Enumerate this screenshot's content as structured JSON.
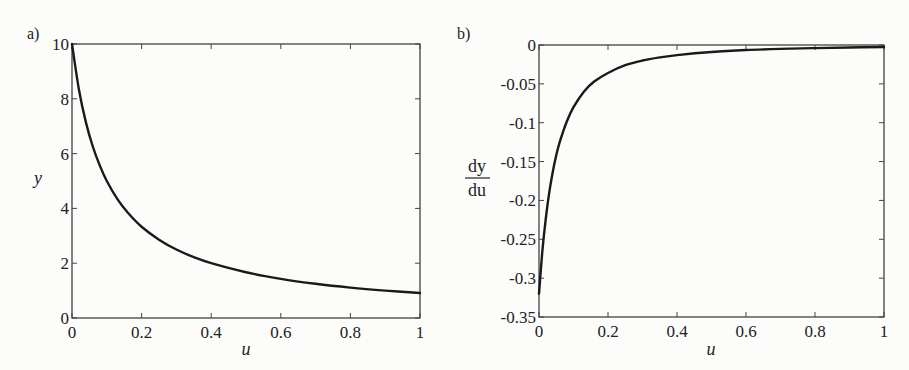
{
  "chart_data": [
    {
      "panel": "a)",
      "type": "line",
      "title": "",
      "xlabel": "u",
      "ylabel": "y",
      "xlim": [
        0,
        1
      ],
      "ylim": [
        0,
        10
      ],
      "xticks": [
        "0",
        "0.2",
        "0.4",
        "0.6",
        "0.8",
        "1"
      ],
      "yticks": [
        "0",
        "2",
        "4",
        "6",
        "8",
        "10"
      ],
      "grid": false,
      "legend": null,
      "series": [
        {
          "name": "y",
          "x": [
            0,
            0.02,
            0.04,
            0.06,
            0.08,
            0.1,
            0.13,
            0.16,
            0.2,
            0.25,
            0.3,
            0.35,
            0.4,
            0.5,
            0.6,
            0.7,
            0.8,
            0.9,
            1.0
          ],
          "values": [
            10.0,
            8.33,
            7.14,
            6.25,
            5.56,
            5.0,
            4.35,
            3.85,
            3.33,
            2.86,
            2.5,
            2.22,
            2.0,
            1.67,
            1.43,
            1.25,
            1.11,
            1.0,
            0.91
          ]
        }
      ]
    },
    {
      "panel": "b)",
      "type": "line",
      "title": "",
      "xlabel": "u",
      "ylabel": "dy/du",
      "ylabel_numerator": "dy",
      "ylabel_denominator": "du",
      "xlim": [
        0,
        1
      ],
      "ylim": [
        -0.35,
        0
      ],
      "xticks": [
        "0",
        "0.2",
        "0.4",
        "0.6",
        "0.8",
        "1"
      ],
      "yticks": [
        "0",
        "-0.05",
        "-0.1",
        "-0.15",
        "-0.2",
        "-0.25",
        "-0.3",
        "-0.35"
      ],
      "grid": false,
      "legend": null,
      "series": [
        {
          "name": "dy/du",
          "x": [
            0,
            0.01,
            0.02,
            0.03,
            0.04,
            0.05,
            0.06,
            0.08,
            0.1,
            0.13,
            0.16,
            0.2,
            0.25,
            0.3,
            0.35,
            0.4,
            0.5,
            0.6,
            0.7,
            0.8,
            0.9,
            1.0
          ],
          "values": [
            -0.32,
            -0.264,
            -0.222,
            -0.189,
            -0.163,
            -0.142,
            -0.125,
            -0.099,
            -0.08,
            -0.06,
            -0.047,
            -0.036,
            -0.026,
            -0.02,
            -0.016,
            -0.013,
            -0.009,
            -0.0065,
            -0.005,
            -0.004,
            -0.0032,
            -0.0026
          ]
        }
      ]
    }
  ]
}
